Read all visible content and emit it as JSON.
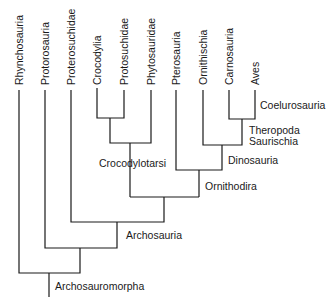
{
  "diagram": {
    "type": "cladogram",
    "root": "Archosauromorpha",
    "leaves": [
      {
        "label": "Rhynchosauria",
        "x": 19,
        "top": 90
      },
      {
        "label": "Protorosauria",
        "x": 45,
        "top": 90
      },
      {
        "label": "Proterosuchidae",
        "x": 71,
        "top": 90
      },
      {
        "label": "Crocodylia",
        "x": 97,
        "top": 88
      },
      {
        "label": "Protosuchidae",
        "x": 124,
        "top": 90
      },
      {
        "label": "Phytosauridae",
        "x": 151,
        "top": 90
      },
      {
        "label": "Pterosauria",
        "x": 176,
        "top": 90
      },
      {
        "label": "Ornithischia",
        "x": 203,
        "top": 90
      },
      {
        "label": "Carnosauria",
        "x": 229,
        "top": 90
      },
      {
        "label": "Aves",
        "x": 255,
        "top": 90
      }
    ],
    "clade_labels": {
      "coelurosauria": "Coelurosauria",
      "theropoda": "Theropoda",
      "saurischia": "Saurischia",
      "dinosauria": "Dinosauria",
      "crocodylotarsi": "Crocodylotarsi",
      "ornithodira": "Ornithodira",
      "archosauria": "Archosauria",
      "archosauromorpha": "Archosauromorpha"
    },
    "line_color": "#1a1a1a",
    "background": "#ffffff"
  }
}
